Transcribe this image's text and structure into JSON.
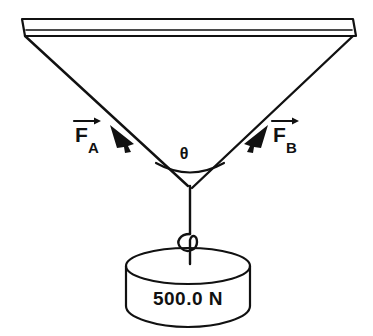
{
  "figure": {
    "background_color": "#ffffff",
    "line_color": "#111111"
  },
  "ceiling": {
    "name": "ceiling-beam",
    "description": "horizontal support beam at top"
  },
  "forces": [
    {
      "id": "F_A",
      "letter": "F",
      "subscript": "A",
      "arrow": "vector-arrow",
      "direction": "up-left"
    },
    {
      "id": "F_B",
      "letter": "F",
      "subscript": "B",
      "arrow": "vector-arrow",
      "direction": "up-right"
    }
  ],
  "angle": {
    "symbol": "θ",
    "name": "theta-angle-between-cables"
  },
  "weight": {
    "label": "500.0 N",
    "value": 500.0,
    "unit": "N",
    "shape": "cylinder"
  },
  "hook": {
    "name": "hook"
  },
  "cord": {
    "name": "vertical-cord"
  }
}
